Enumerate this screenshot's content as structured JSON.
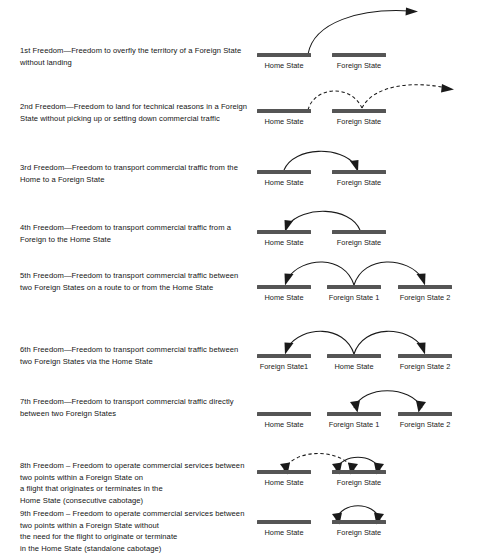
{
  "document": {
    "title": "Freedoms of the Air",
    "background_color": "#ffffff",
    "bar_color": "#555555",
    "line_color": "#1a1a1a"
  },
  "freedoms": [
    {
      "id": "freedom-1",
      "description": "1st Freedom—Freedom to overfly the territory of a Foreign State without landing",
      "states": [
        "Home State",
        "Foreign State"
      ],
      "route_style": "solid",
      "route": "overfly past Foreign State"
    },
    {
      "id": "freedom-2",
      "description": "2nd Freedom—Freedom to land for technical reasons in a Foreign State without picking up or setting down commercial traffic",
      "states": [
        "Home State",
        "Foreign State"
      ],
      "route_style": "dashed",
      "route": "Home State to Foreign State then onward"
    },
    {
      "id": "freedom-3",
      "description": "3rd Freedom—Freedom to transport commercial traffic from the Home to a Foreign State",
      "states": [
        "Home State",
        "Foreign State"
      ],
      "route_style": "solid",
      "route": "Home State to Foreign State"
    },
    {
      "id": "freedom-4",
      "description": "4th Freedom—Freedom to transport commercial traffic from a Foreign to the Home State",
      "states": [
        "Home State",
        "Foreign State"
      ],
      "route_style": "solid",
      "route": "Foreign State to Home State"
    },
    {
      "id": "freedom-5",
      "description": "5th Freedom—Freedom to transport commercial traffic between two Foreign States on a route to or from the Home State",
      "states": [
        "Home State",
        "Foreign State 1",
        "Foreign State 2"
      ],
      "route_style": "solid",
      "route": "Foreign State 1 to Home State and to Foreign State 2"
    },
    {
      "id": "freedom-6",
      "description": "6th Freedom—Freedom to transport commercial traffic between two Foreign States via the Home State",
      "states": [
        "Foreign State1",
        "Home State",
        "Foreign State 2"
      ],
      "route_style": "solid",
      "route": "Home State to Foreign State1 and to Foreign State 2"
    },
    {
      "id": "freedom-7",
      "description": "7th Freedom—Freedom to transport commercial traffic directly between two Foreign States",
      "states": [
        "Home State",
        "Foreign State 1",
        "Foreign State 2"
      ],
      "route_style": "solid",
      "route": "Foreign State 1 to Foreign State 2"
    },
    {
      "id": "freedom-8",
      "description": "8th Freedom – Freedom to operate commercial services between two points within a Foreign State on\na flight that originates or terminates in the\nHome State (consecutive cabotage)",
      "states": [
        "Home State",
        "Foreign State"
      ],
      "route_style": "dashed+solid",
      "route": "Home State to Foreign State plus internal Foreign State hop"
    },
    {
      "id": "freedom-9",
      "description": "9th Freedom – Freedom to operate commercial services between two points within a Foreign State without\nthe need for the flight to originate or terminate\nin the Home State (standalone cabotage)",
      "states": [
        "Home State",
        "Foreign State"
      ],
      "route_style": "solid",
      "route": "internal Foreign State hop only"
    }
  ]
}
